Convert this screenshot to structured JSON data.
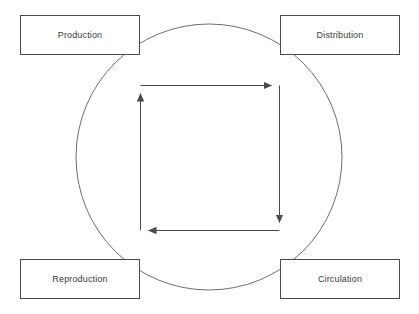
{
  "canvas": {
    "width": 419,
    "height": 314,
    "background_color": "#ffffff"
  },
  "diagram": {
    "type": "cycle-diagram",
    "title": "",
    "stroke_color": "#6e6e6e",
    "box_border_color": "#4a4a4a",
    "text_color": "#3a3a3a",
    "nodes": [
      {
        "id": "production",
        "label": "Production",
        "position": "top-left",
        "x": 20,
        "y": 15,
        "width": 120,
        "height": 40
      },
      {
        "id": "distribution",
        "label": "Distribution",
        "position": "top-right",
        "x": 280,
        "y": 15,
        "width": 120,
        "height": 40
      },
      {
        "id": "reproduction",
        "label": "Reproduction",
        "position": "bottom-left",
        "x": 20,
        "y": 259,
        "width": 120,
        "height": 40
      },
      {
        "id": "circulation",
        "label": "Circulation",
        "position": "bottom-right",
        "x": 280,
        "y": 259,
        "width": 120,
        "height": 40
      }
    ],
    "circle": {
      "center_x": 209,
      "center_y": 157,
      "radius": 133,
      "stroke_width": 1,
      "fill": "none"
    },
    "inner_square": {
      "left": 140,
      "top": 85,
      "right": 280,
      "bottom": 231,
      "stroke_width": 1,
      "fill": "none",
      "flow_direction": "clockwise",
      "arrows": [
        {
          "id": "arrow-top",
          "from": "left",
          "to": "right",
          "head": "right",
          "head_x": 280,
          "head_y": 85
        },
        {
          "id": "arrow-right",
          "from": "top",
          "to": "bottom",
          "head": "down",
          "head_x": 280,
          "head_y": 231
        },
        {
          "id": "arrow-bottom",
          "from": "right",
          "to": "left",
          "head": "left",
          "head_x": 140,
          "head_y": 231
        },
        {
          "id": "arrow-left",
          "from": "bottom",
          "to": "top",
          "head": "up",
          "head_x": 140,
          "head_y": 85
        }
      ]
    }
  }
}
